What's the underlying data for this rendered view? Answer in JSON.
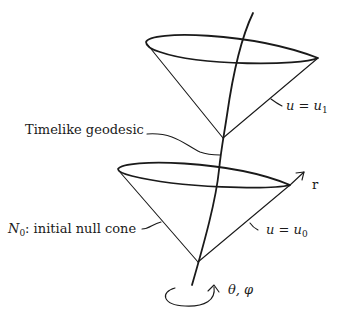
{
  "diagram": {
    "labels": {
      "timelike_geodesic": "Timelike geodesic",
      "initial_null_cone_symbol": "N",
      "initial_null_cone_sub": "0",
      "initial_null_cone_text": ": initial null cone",
      "upper_cone_lhs": "u",
      "upper_cone_eq": " = ",
      "upper_cone_rhs": "u",
      "upper_cone_sub": "1",
      "lower_cone_lhs": "u",
      "lower_cone_eq": " = ",
      "lower_cone_rhs": "u",
      "lower_cone_sub": "0",
      "radial_axis": "r",
      "angular_coords": "θ, φ"
    },
    "elements": {
      "upper_cone": "null cone u = u1",
      "lower_cone": "initial null cone N0 (u = u0)",
      "geodesic": "timelike geodesic worldline",
      "radial_arrow": "r direction",
      "rotation_arrow": "angular rotation (θ, φ)"
    },
    "colors": {
      "ink": "#1a1a1a",
      "background": "#ffffff"
    }
  }
}
